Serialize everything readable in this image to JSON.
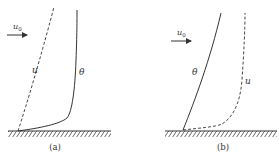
{
  "diagram": {
    "panels": [
      {
        "id": "a",
        "caption": "(a)",
        "flow_label": "u",
        "flow_subscript": "0",
        "curve_u_label": "u",
        "curve_theta_label": "θ",
        "description": "velocity boundary layer thinner than thermal boundary layer"
      },
      {
        "id": "b",
        "caption": "(b)",
        "flow_label": "u",
        "flow_subscript": "0",
        "curve_u_label": "u",
        "curve_theta_label": "θ",
        "description": "thermal boundary layer thinner than velocity boundary layer"
      }
    ],
    "legend": {
      "dashed": "u",
      "solid": "θ"
    },
    "colors": {
      "line": "#333333",
      "background": "#ffffff"
    }
  }
}
